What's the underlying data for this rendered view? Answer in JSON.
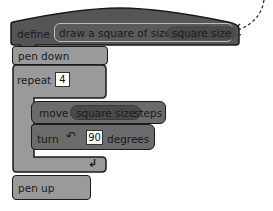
{
  "script": {
    "define_block": {
      "keyword": "define",
      "custom_block_label": "draw a square of size",
      "parameter": "square size"
    },
    "blocks": [
      {
        "type": "pen",
        "label": "pen down"
      },
      {
        "type": "repeat",
        "label": "repeat",
        "count": "4",
        "inner": [
          {
            "type": "move",
            "label_before": "move",
            "param": "square size",
            "label_after": "steps"
          },
          {
            "type": "turn",
            "label_before": "turn",
            "icon": "rotate-left-icon",
            "value": "90",
            "label_after": "degrees"
          }
        ],
        "loop_icon": "loop-arrow-icon"
      },
      {
        "type": "pen",
        "label": "pen up"
      }
    ]
  },
  "annotation": {
    "arrow": "dashed-curved-arrow"
  },
  "colors": {
    "define_block": "#555555",
    "pen_block": "#9a9a9a",
    "repeat_block": "#9a9a9a",
    "motion_block": "#6b6b6b",
    "param_pill": "#4a4a4a",
    "outline": "#1a1a1a"
  }
}
